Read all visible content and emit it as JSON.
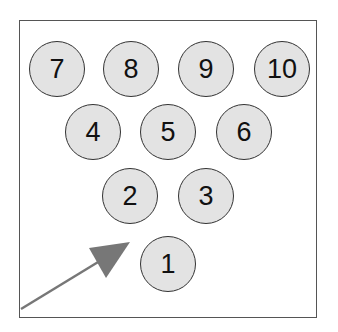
{
  "diagram": {
    "pins": [
      {
        "label": "7",
        "x": 57,
        "y": 69
      },
      {
        "label": "8",
        "x": 131,
        "y": 69
      },
      {
        "label": "9",
        "x": 206,
        "y": 69
      },
      {
        "label": "10",
        "x": 282,
        "y": 69
      },
      {
        "label": "4",
        "x": 93,
        "y": 132
      },
      {
        "label": "5",
        "x": 168,
        "y": 132
      },
      {
        "label": "6",
        "x": 244,
        "y": 132
      },
      {
        "label": "2",
        "x": 130,
        "y": 196
      },
      {
        "label": "3",
        "x": 206,
        "y": 196
      },
      {
        "label": "1",
        "x": 168,
        "y": 264
      }
    ],
    "arrow": {
      "from": [
        21,
        310
      ],
      "to": [
        130,
        243
      ],
      "color": "#777777"
    },
    "colors": {
      "pin_fill": "#e3e3e3",
      "pin_stroke": "#333333",
      "frame": "#555555"
    }
  }
}
